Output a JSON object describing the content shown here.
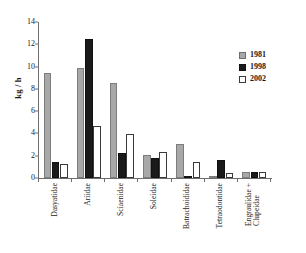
{
  "chart_data": {
    "type": "bar",
    "title": "",
    "xlabel": "",
    "ylabel": "kg / h",
    "ylim": [
      0,
      14
    ],
    "yticks": [
      0,
      2,
      4,
      6,
      8,
      10,
      12,
      14
    ],
    "ytick_labels": [
      "0",
      "2",
      "4",
      "6",
      "8",
      "10",
      "12",
      "14"
    ],
    "grid": false,
    "legend_position": "top-right",
    "categories": [
      "Dasyatidae",
      "Ariidae",
      "Sciaenidae",
      "Soleidae",
      "Batrachoididae",
      "Tetraodontidae",
      "Engraulidae +\nClupeidae"
    ],
    "category_lines": [
      [
        "Dasyatidae"
      ],
      [
        "Ariidae"
      ],
      [
        "Sciaenidae"
      ],
      [
        "Soleidae"
      ],
      [
        "Batrachoididae"
      ],
      [
        "Tetraodontidae"
      ],
      [
        "Engraulidae +",
        "Clupeidae"
      ]
    ],
    "series": [
      {
        "name": "1981",
        "color": "#a8a8a8",
        "values": [
          9.4,
          9.9,
          8.5,
          2.05,
          3.05,
          0.15,
          0.55
        ]
      },
      {
        "name": "1998",
        "color": "#1a1a1a",
        "values": [
          1.4,
          12.5,
          2.25,
          1.8,
          0.15,
          1.6,
          0.55
        ]
      },
      {
        "name": "2002",
        "color": "#ffffff",
        "values": [
          1.25,
          4.65,
          3.95,
          2.3,
          1.45,
          0.45,
          0.5
        ]
      }
    ]
  },
  "legend": {
    "items": [
      {
        "label": "1981",
        "swatch": "gray-swatch"
      },
      {
        "label": "1998",
        "swatch": "black-swatch"
      },
      {
        "label": "2002",
        "swatch": "white-swatch"
      }
    ]
  },
  "axes": {
    "y_axis_title": "kg / h"
  }
}
